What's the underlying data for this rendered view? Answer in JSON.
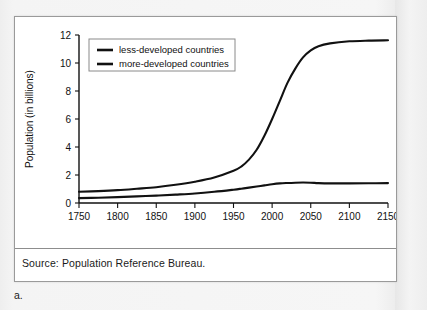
{
  "figure": {
    "caption_label": "a.",
    "source_note": "Source: Population Reference Bureau."
  },
  "chart_data": {
    "type": "line",
    "title": "",
    "xlabel": "",
    "ylabel": "Population (in billions)",
    "xlim": [
      1750,
      2150
    ],
    "ylim": [
      0,
      12
    ],
    "xticks": [
      1750,
      1800,
      1850,
      1900,
      1950,
      2000,
      2050,
      2100,
      2150
    ],
    "xtick_labels": [
      "1750",
      "1800",
      "1850",
      "1900",
      "1950",
      "2000",
      "2050",
      "2100",
      "2150"
    ],
    "yticks": [
      0,
      2,
      4,
      6,
      8,
      10,
      12
    ],
    "ytick_labels": [
      "0",
      "2",
      "4",
      "6",
      "8",
      "10",
      "12"
    ],
    "grid": false,
    "legend_position": "upper-left",
    "x": [
      1750,
      1775,
      1800,
      1825,
      1850,
      1875,
      1900,
      1925,
      1950,
      1960,
      1970,
      1980,
      1990,
      2000,
      2010,
      2020,
      2030,
      2040,
      2050,
      2060,
      2075,
      2100,
      2125,
      2150
    ],
    "series": [
      {
        "name": "less-developed countries",
        "color": "#111111",
        "values": [
          0.8,
          0.85,
          0.92,
          1.02,
          1.13,
          1.3,
          1.52,
          1.82,
          2.3,
          2.6,
          3.1,
          3.8,
          4.8,
          6.0,
          7.3,
          8.6,
          9.6,
          10.4,
          10.9,
          11.2,
          11.4,
          11.55,
          11.6,
          11.62
        ]
      },
      {
        "name": "more-developed countries",
        "color": "#111111",
        "values": [
          0.35,
          0.38,
          0.42,
          0.47,
          0.53,
          0.6,
          0.68,
          0.8,
          0.95,
          1.02,
          1.1,
          1.18,
          1.26,
          1.34,
          1.4,
          1.43,
          1.45,
          1.46,
          1.45,
          1.42,
          1.4,
          1.4,
          1.41,
          1.42
        ]
      }
    ]
  }
}
